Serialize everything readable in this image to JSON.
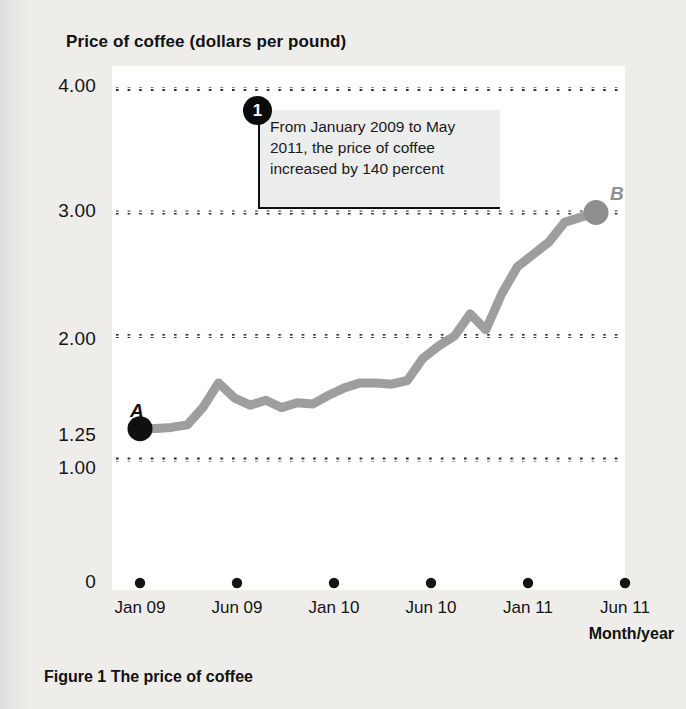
{
  "title": "Price of coffee (dollars per pound)",
  "x_axis_title": "Month/year",
  "figure_caption": "Figure 1  The price of coffee",
  "callout": {
    "number": "1",
    "text": "From January 2009 to May 2011, the price of coffee increased by 140 percent"
  },
  "annotations": {
    "point_a_label": "A",
    "point_b_label": "B"
  },
  "colors": {
    "line": "#9e9e9e",
    "point_a": "#101010",
    "point_b": "#8e8e8e",
    "grid": "#2a2a2a",
    "plot_bg": "#ffffff",
    "page_bg": "#eeedea"
  },
  "chart_data": {
    "type": "line",
    "title": "Price of coffee (dollars per pound)",
    "xlabel": "Month/year",
    "ylabel": "Price of coffee (dollars per pound)",
    "ylim": [
      0,
      4.3
    ],
    "grid": true,
    "legend": false,
    "y_ticks": [
      0,
      1.0,
      1.25,
      2.0,
      3.0,
      4.0
    ],
    "y_tick_labels": [
      "0",
      "1.00",
      "1.25",
      "2.00",
      "3.00",
      "4.00"
    ],
    "x_tick_labels": [
      "Jan 09",
      "Jun 09",
      "Jan 10",
      "Jun 10",
      "Jan 11",
      "Jun 11"
    ],
    "x_tick_positions": [
      0,
      5,
      12,
      17,
      24,
      29
    ],
    "x": [
      0,
      1,
      2,
      3,
      4,
      5,
      6,
      7,
      8,
      9,
      10,
      11,
      12,
      13,
      14,
      15,
      16,
      17,
      18,
      19,
      20,
      21,
      22,
      23,
      24,
      25,
      26,
      27,
      28,
      29
    ],
    "values": [
      1.25,
      1.25,
      1.26,
      1.28,
      1.42,
      1.62,
      1.5,
      1.44,
      1.48,
      1.42,
      1.46,
      1.45,
      1.52,
      1.58,
      1.62,
      1.62,
      1.61,
      1.64,
      1.82,
      1.92,
      2.0,
      2.18,
      2.05,
      2.34,
      2.56,
      2.66,
      2.76,
      2.92,
      2.96,
      3.0
    ],
    "markers": [
      {
        "label": "A",
        "x": 0,
        "y": 1.25,
        "color": "#101010",
        "note": "January 2009"
      },
      {
        "label": "B",
        "x": 29,
        "y": 3.0,
        "color": "#8e8e8e",
        "note": "May 2011"
      }
    ],
    "annotation": "From January 2009 to May 2011, the price of coffee increased by 140 percent"
  }
}
